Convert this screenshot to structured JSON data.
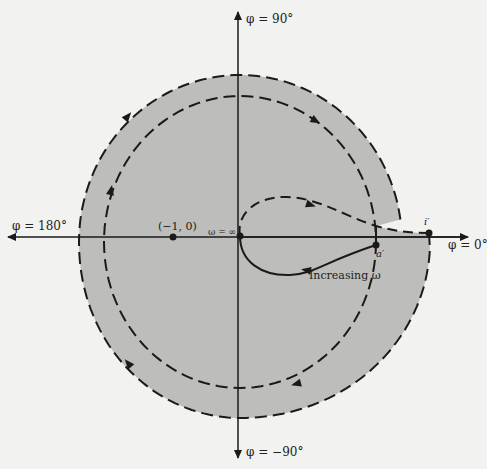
{
  "diagram": {
    "type": "nyquist-plot",
    "axes": {
      "top_label": "φ = 90°",
      "bottom_label": "φ = −90°",
      "left_label": "φ = 180°",
      "right_label": "φ = 0°"
    },
    "points": {
      "critical_point": "(−1, 0)",
      "omega_infinity": "ω = ∞",
      "a_prime": "a′",
      "i_prime": "i′"
    },
    "annotations": {
      "increasing_omega": "Increasing ω"
    },
    "colors": {
      "shaded_region": "#bdbdbb",
      "background": "#f2f2f0",
      "ink": "#1a1a1a"
    }
  }
}
